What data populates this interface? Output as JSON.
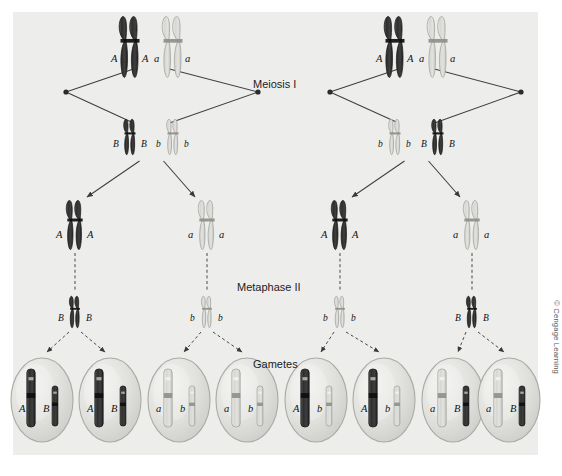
{
  "figure": {
    "credit": "© Cengage Learning",
    "background_color": "#ededec",
    "page_color": "#ffffff",
    "dark_chromosome_color": "#3b3b3b",
    "light_chromosome_color": "#d2d2cf",
    "cell_color": "#dcdcda",
    "line_color": "#4a4a4a"
  },
  "stages": [
    {
      "id": "meiosis-i",
      "label": "Meiosis I",
      "x": 253,
      "y": 78
    },
    {
      "id": "metaphase-ii",
      "label": "Metaphase II",
      "x": 237,
      "y": 281
    },
    {
      "id": "gametes",
      "label": "Gametes",
      "x": 253,
      "y": 358
    }
  ],
  "meiosis_one": [
    {
      "id": "left-arrangement",
      "apex_left_x": 66,
      "apex_right_x": 258,
      "top_pairs": [
        {
          "allele_left": "A",
          "allele_right": "A",
          "shade": "dark",
          "x": 130
        },
        {
          "allele_left": "a",
          "allele_right": "a",
          "shade": "light",
          "x": 173
        }
      ],
      "bottom_pairs": [
        {
          "allele_left": "B",
          "allele_right": "B",
          "shade": "dark",
          "x": 130
        },
        {
          "allele_left": "b",
          "allele_right": "b",
          "shade": "light",
          "x": 173
        }
      ]
    },
    {
      "id": "right-arrangement",
      "apex_left_x": 330,
      "apex_right_x": 521,
      "top_pairs": [
        {
          "allele_left": "A",
          "allele_right": "A",
          "shade": "dark",
          "x": 395
        },
        {
          "allele_left": "a",
          "allele_right": "a",
          "shade": "light",
          "x": 438
        }
      ],
      "bottom_pairs": [
        {
          "allele_left": "b",
          "allele_right": "b",
          "shade": "light",
          "x": 395
        },
        {
          "allele_left": "B",
          "allele_right": "B",
          "shade": "dark",
          "x": 438
        }
      ]
    }
  ],
  "metaphase_two": [
    {
      "id": "m2-1",
      "x": 75,
      "upper": {
        "allele_left": "A",
        "allele_right": "A",
        "shade": "dark"
      },
      "lower": {
        "allele_left": "B",
        "allele_right": "B",
        "shade": "dark"
      }
    },
    {
      "id": "m2-2",
      "x": 207,
      "upper": {
        "allele_left": "a",
        "allele_right": "a",
        "shade": "light"
      },
      "lower": {
        "allele_left": "b",
        "allele_right": "b",
        "shade": "light"
      }
    },
    {
      "id": "m2-3",
      "x": 340,
      "upper": {
        "allele_left": "A",
        "allele_right": "A",
        "shade": "dark"
      },
      "lower": {
        "allele_left": "b",
        "allele_right": "b",
        "shade": "light"
      }
    },
    {
      "id": "m2-4",
      "x": 472,
      "upper": {
        "allele_left": "a",
        "allele_right": "a",
        "shade": "light"
      },
      "lower": {
        "allele_left": "B",
        "allele_right": "B",
        "shade": "dark"
      }
    }
  ],
  "gametes": [
    {
      "id": "gamete-1",
      "x": 42,
      "genotype": "A B",
      "chrom_a": {
        "allele": "A",
        "shade": "dark"
      },
      "chrom_b": {
        "allele": "B",
        "shade": "dark"
      }
    },
    {
      "id": "gamete-2",
      "x": 110,
      "genotype": "A B",
      "chrom_a": {
        "allele": "A",
        "shade": "dark"
      },
      "chrom_b": {
        "allele": "B",
        "shade": "dark"
      }
    },
    {
      "id": "gamete-3",
      "x": 179,
      "genotype": "a b",
      "chrom_a": {
        "allele": "a",
        "shade": "light"
      },
      "chrom_b": {
        "allele": "b",
        "shade": "light"
      }
    },
    {
      "id": "gamete-4",
      "x": 247,
      "genotype": "a b",
      "chrom_a": {
        "allele": "a",
        "shade": "light"
      },
      "chrom_b": {
        "allele": "b",
        "shade": "light"
      }
    },
    {
      "id": "gamete-5",
      "x": 316,
      "genotype": "A b",
      "chrom_a": {
        "allele": "A",
        "shade": "dark"
      },
      "chrom_b": {
        "allele": "b",
        "shade": "light"
      }
    },
    {
      "id": "gamete-6",
      "x": 384,
      "genotype": "A b",
      "chrom_a": {
        "allele": "A",
        "shade": "dark"
      },
      "chrom_b": {
        "allele": "b",
        "shade": "light"
      }
    },
    {
      "id": "gamete-7",
      "x": 453,
      "genotype": "a B",
      "chrom_a": {
        "allele": "a",
        "shade": "light"
      },
      "chrom_b": {
        "allele": "B",
        "shade": "dark"
      }
    },
    {
      "id": "gamete-8",
      "x": 509,
      "genotype": "a B",
      "chrom_a": {
        "allele": "a",
        "shade": "light"
      },
      "chrom_b": {
        "allele": "B",
        "shade": "dark"
      }
    }
  ]
}
